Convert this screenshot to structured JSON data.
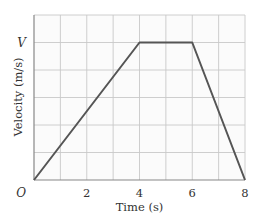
{
  "chart_data": {
    "type": "line",
    "title": "",
    "xlabel": "Time (s)",
    "ylabel": "Velocity (m/s)",
    "x": [
      0,
      4,
      6,
      8
    ],
    "y_symbolic": [
      "0",
      "V",
      "V",
      "0"
    ],
    "series": [
      {
        "name": "velocity",
        "x": [
          0,
          4,
          6,
          8
        ],
        "y": [
          0,
          1,
          1,
          0
        ],
        "y_unit": "V"
      }
    ],
    "xlim": [
      0,
      8
    ],
    "ylim": [
      0,
      1.2
    ],
    "x_ticks": [
      {
        "value": 0,
        "label": "O"
      },
      {
        "value": 2,
        "label": "2"
      },
      {
        "value": 4,
        "label": "4"
      },
      {
        "value": 6,
        "label": "6"
      },
      {
        "value": 8,
        "label": "8"
      }
    ],
    "y_ticks": [
      {
        "value": 1,
        "label": "V"
      }
    ],
    "grid": true,
    "grid_x_divisions": 8,
    "grid_y_divisions": 6,
    "legend": null,
    "colors": {
      "line": "#555555",
      "grid": "#c8c8c8",
      "axis": "#888888",
      "background": "#fbfbfb"
    }
  },
  "labels": {
    "origin": "O",
    "v_tick": "V",
    "x2": "2",
    "x4": "4",
    "x6": "6",
    "x8": "8",
    "xlabel": "Time (s)",
    "ylabel": "Velocity (m/s)"
  }
}
